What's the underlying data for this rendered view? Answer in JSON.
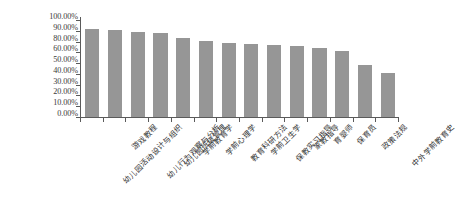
{
  "chart_data": {
    "type": "bar",
    "title": "",
    "subtitle": "",
    "xlabel": "",
    "ylabel": "",
    "grid": false,
    "legend": false,
    "legend_position": "none",
    "bar_color": "#969696",
    "axis_color": "#5a5a5a",
    "ylim": [
      0,
      1.0
    ],
    "y_tick_labels": [
      "100.00%",
      "90.00%",
      "80.00%",
      "60.00%",
      "50.00%",
      "40.00%",
      "30.00%",
      "20.00%",
      "10.00%",
      "0.00%"
    ],
    "y_tick_values": [
      1.0,
      0.9,
      0.8,
      0.6,
      0.5,
      0.4,
      0.3,
      0.2,
      0.1,
      0.0
    ],
    "categories": [
      "幼儿园活动设计与组织",
      "游戏教程",
      "幼儿行为观察与分析",
      "幼儿园班级管理",
      "学前教育学",
      "学前心理学",
      "教育科研方法",
      "学前卫生学",
      "保教实习指导",
      "家教指导",
      "育婴师",
      "保育员",
      "政策法规",
      "中外学前教育史"
    ],
    "values": [
      0.88,
      0.87,
      0.85,
      0.84,
      0.79,
      0.76,
      0.74,
      0.73,
      0.72,
      0.71,
      0.69,
      0.66,
      0.52,
      0.44
    ],
    "value_labels": [
      "88.00%",
      "87.00%",
      "85.00%",
      "84.00%",
      "79.00%",
      "76.00%",
      "74.00%",
      "73.00%",
      "72.00%",
      "71.00%",
      "69.00%",
      "66.00%",
      "52.00%",
      "44.00%"
    ]
  }
}
